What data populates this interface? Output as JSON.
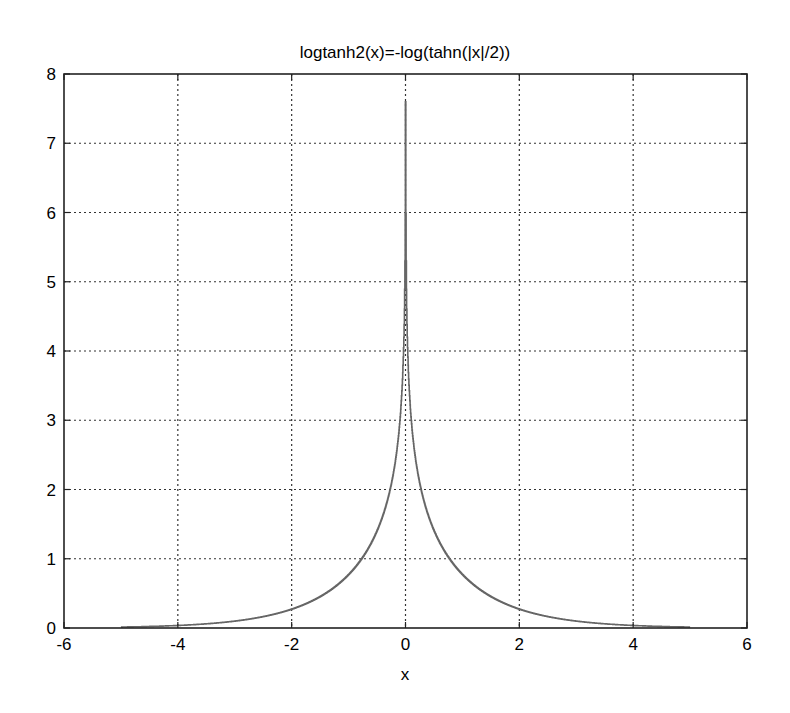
{
  "chart_data": {
    "type": "line",
    "title": "logtanh2(x)=-log(tahn(|x|/2))",
    "xlabel": "x",
    "ylabel": "",
    "xlim": [
      -6,
      6
    ],
    "ylim": [
      0,
      8
    ],
    "xticks": [
      -6,
      -4,
      -2,
      0,
      2,
      4,
      6
    ],
    "yticks": [
      0,
      1,
      2,
      3,
      4,
      5,
      6,
      7,
      8
    ],
    "xtick_labels": [
      "-6",
      "-4",
      "-2",
      "0",
      "2",
      "4",
      "6"
    ],
    "ytick_labels": [
      "0",
      "1",
      "2",
      "3",
      "4",
      "5",
      "6",
      "7",
      "8"
    ],
    "grid": true,
    "grid_style": "dotted",
    "legend": null,
    "series": [
      {
        "name": "logtanh2(x)",
        "formula": "-log(tanh(|x|/2))",
        "color": "#666666",
        "peak": 7.6,
        "x": [
          -5.0,
          -4.5,
          -4.0,
          -3.5,
          -3.0,
          -2.5,
          -2.0,
          -1.5,
          -1.0,
          -0.75,
          -0.5,
          -0.3,
          -0.2,
          -0.1,
          -0.05,
          -0.02,
          -0.01,
          -0.001,
          0.001,
          0.01,
          0.02,
          0.05,
          0.1,
          0.2,
          0.3,
          0.5,
          0.75,
          1.0,
          1.5,
          2.0,
          2.5,
          3.0,
          3.5,
          4.0,
          4.5,
          5.0
        ],
        "y": [
          0.0135,
          0.0222,
          0.0366,
          0.0604,
          0.0998,
          0.1656,
          0.2773,
          0.4686,
          0.7719,
          1.0153,
          1.3959,
          1.8999,
          2.3008,
          2.9962,
          3.6891,
          4.6052,
          5.2983,
          7.6009,
          7.6009,
          5.2983,
          4.6052,
          3.6891,
          2.9962,
          2.3008,
          1.8999,
          1.3959,
          1.0153,
          0.7719,
          0.4686,
          0.2773,
          0.1656,
          0.0998,
          0.0604,
          0.0366,
          0.0222,
          0.0135
        ]
      }
    ]
  },
  "colors": {
    "axes": "#222222",
    "grid": "#333333",
    "line": "#666666",
    "background": "#ffffff"
  }
}
